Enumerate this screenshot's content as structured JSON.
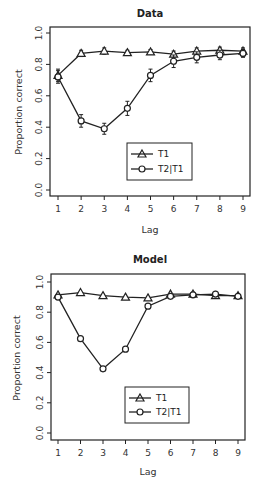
{
  "chart_data": [
    {
      "type": "line",
      "title": "Data",
      "xlabel": "Lag",
      "ylabel": "Proportion correct",
      "x": [
        1,
        2,
        3,
        4,
        5,
        6,
        7,
        8,
        9
      ],
      "xticks": [
        "1",
        "2",
        "3",
        "4",
        "5",
        "6",
        "7",
        "8",
        "9"
      ],
      "yticks": [
        "0.0",
        "0.2",
        "0.4",
        "0.6",
        "0.8",
        "1.0"
      ],
      "ylim": [
        0,
        1
      ],
      "grid": false,
      "error_bars": true,
      "legend_position": "lower center",
      "series": [
        {
          "name": "T1",
          "marker": "triangle",
          "values": [
            0.73,
            0.87,
            0.885,
            0.875,
            0.88,
            0.865,
            0.885,
            0.89,
            0.885
          ],
          "errors": [
            0.04,
            0.02,
            0.02,
            0.015,
            0.015,
            0.02,
            0.02,
            0.02,
            0.02
          ]
        },
        {
          "name": "T2|T1",
          "marker": "circle",
          "values": [
            0.72,
            0.44,
            0.39,
            0.52,
            0.73,
            0.82,
            0.845,
            0.86,
            0.87
          ],
          "errors": [
            0.04,
            0.04,
            0.035,
            0.045,
            0.04,
            0.04,
            0.035,
            0.03,
            0.025
          ]
        }
      ]
    },
    {
      "type": "line",
      "title": "Model",
      "xlabel": "Lag",
      "ylabel": "Proportion correct",
      "x": [
        1,
        2,
        3,
        4,
        5,
        6,
        7,
        8,
        9
      ],
      "xticks": [
        "1",
        "2",
        "3",
        "4",
        "5",
        "6",
        "7",
        "8",
        "9"
      ],
      "yticks": [
        "0.0",
        "0.2",
        "0.4",
        "0.6",
        "0.8",
        "1.0"
      ],
      "ylim": [
        0,
        1
      ],
      "grid": false,
      "error_bars": false,
      "legend_position": "lower center",
      "series": [
        {
          "name": "T1",
          "marker": "triangle",
          "values": [
            0.915,
            0.93,
            0.91,
            0.9,
            0.895,
            0.92,
            0.92,
            0.91,
            0.91
          ]
        },
        {
          "name": "T2|T1",
          "marker": "circle",
          "values": [
            0.9,
            0.625,
            0.425,
            0.555,
            0.84,
            0.905,
            0.915,
            0.92,
            0.905
          ]
        }
      ]
    }
  ],
  "legend": {
    "t1_label": "T1",
    "t2_label": "T2|T1"
  },
  "panels": {
    "data_title": "Data",
    "model_title": "Model",
    "xlabel": "Lag",
    "ylabel": "Proportion correct"
  }
}
